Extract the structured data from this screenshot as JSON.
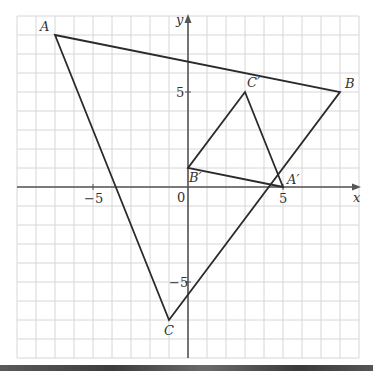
{
  "diagram": {
    "type": "coordinate-transformation",
    "axes": {
      "x_label": "x",
      "y_label": "y",
      "origin_label": "0",
      "x_ticks": [
        {
          "value": -5,
          "label": "−5"
        },
        {
          "value": 5,
          "label": "5"
        }
      ],
      "y_ticks": [
        {
          "value": 5,
          "label": "5"
        },
        {
          "value": -5,
          "label": "−5"
        }
      ],
      "range": {
        "xmin": -9,
        "xmax": 9,
        "ymin": -9,
        "ymax": 9
      }
    },
    "triangles": [
      {
        "name": "ABC",
        "vertices": [
          {
            "label": "A",
            "x": -7,
            "y": 8
          },
          {
            "label": "B",
            "x": 8,
            "y": 5
          },
          {
            "label": "C",
            "x": -1,
            "y": -7
          }
        ]
      },
      {
        "name": "A'B'C'",
        "vertices": [
          {
            "label": "A′",
            "x": 5,
            "y": 0
          },
          {
            "label": "B′",
            "x": 0,
            "y": 1
          },
          {
            "label": "C′",
            "x": 3,
            "y": 5
          }
        ]
      }
    ],
    "colors": {
      "grid": "#d6d6d6",
      "axis": "#555555",
      "shape": "#2a2a2a",
      "text": "#333333"
    }
  }
}
